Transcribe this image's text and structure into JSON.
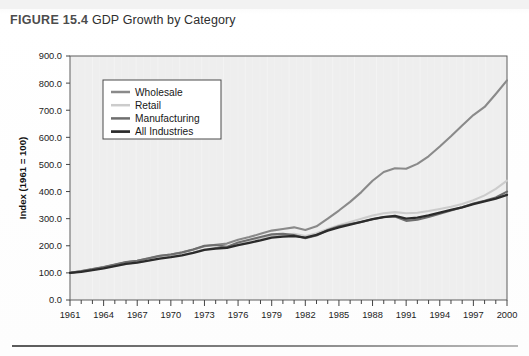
{
  "figure": {
    "number_label": "FIGURE 15.4",
    "caption": "GDP Growth by Category"
  },
  "chart_data": {
    "type": "line",
    "title": "GDP Growth by Category",
    "xlabel": "",
    "ylabel": "Index (1961 = 100)",
    "xlim": [
      1961,
      2000
    ],
    "ylim": [
      0,
      900
    ],
    "ytick_labels": [
      "0.0",
      "100.0",
      "200.0",
      "300.0",
      "400.0",
      "500.0",
      "600.0",
      "700.0",
      "800.0",
      "900.0"
    ],
    "ytick_values": [
      0,
      100,
      200,
      300,
      400,
      500,
      600,
      700,
      800,
      900
    ],
    "xtick_labels": [
      "1961",
      "1964",
      "1967",
      "1970",
      "1973",
      "1976",
      "1979",
      "1982",
      "1985",
      "1988",
      "1991",
      "1994",
      "1997",
      "2000"
    ],
    "xtick_values": [
      1961,
      1964,
      1967,
      1970,
      1973,
      1976,
      1979,
      1982,
      1985,
      1988,
      1991,
      1994,
      1997,
      2000
    ],
    "minor_xticks_every": 1,
    "grid": false,
    "legend_position": "upper-left-inside",
    "plot_background": "#eeeeee",
    "x": [
      1961,
      1962,
      1963,
      1964,
      1965,
      1966,
      1967,
      1968,
      1969,
      1970,
      1971,
      1972,
      1973,
      1974,
      1975,
      1976,
      1977,
      1978,
      1979,
      1980,
      1981,
      1982,
      1983,
      1984,
      1985,
      1986,
      1987,
      1988,
      1989,
      1990,
      1991,
      1992,
      1993,
      1994,
      1995,
      1996,
      1997,
      1998,
      1999,
      2000
    ],
    "series": [
      {
        "name": "Wholesale",
        "color": "#8a8a8a",
        "width": 2.1,
        "values": [
          100,
          106,
          113,
          121,
          130,
          139,
          145,
          153,
          162,
          168,
          176,
          186,
          198,
          204,
          208,
          222,
          232,
          244,
          256,
          262,
          268,
          258,
          272,
          300,
          330,
          362,
          398,
          440,
          472,
          486,
          484,
          502,
          530,
          566,
          604,
          644,
          682,
          712,
          760,
          810
        ]
      },
      {
        "name": "Retail",
        "color": "#cccccc",
        "width": 2.1,
        "values": [
          100,
          105,
          111,
          118,
          126,
          133,
          139,
          146,
          154,
          160,
          167,
          176,
          186,
          191,
          195,
          206,
          215,
          225,
          235,
          240,
          244,
          236,
          246,
          262,
          276,
          288,
          300,
          312,
          320,
          324,
          320,
          322,
          328,
          336,
          344,
          354,
          368,
          386,
          410,
          440
        ]
      },
      {
        "name": "Manufacturing",
        "color": "#6e6e6e",
        "width": 2.1,
        "values": [
          100,
          107,
          114,
          122,
          131,
          140,
          145,
          154,
          163,
          168,
          175,
          186,
          200,
          203,
          196,
          212,
          222,
          232,
          242,
          244,
          240,
          228,
          238,
          258,
          272,
          280,
          288,
          298,
          306,
          308,
          292,
          296,
          306,
          318,
          330,
          342,
          356,
          366,
          378,
          400
        ]
      },
      {
        "name": "All Industries",
        "color": "#2b2b2b",
        "width": 2.3,
        "values": [
          100,
          104,
          110,
          117,
          125,
          133,
          138,
          145,
          153,
          158,
          165,
          174,
          185,
          190,
          192,
          202,
          211,
          220,
          230,
          234,
          236,
          230,
          240,
          256,
          268,
          278,
          288,
          298,
          306,
          310,
          300,
          304,
          312,
          322,
          332,
          342,
          354,
          364,
          374,
          388
        ]
      }
    ]
  }
}
